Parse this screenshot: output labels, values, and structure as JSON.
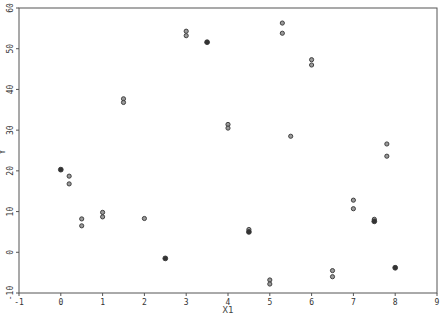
{
  "chart_data": {
    "type": "scatter",
    "title": "",
    "xlabel": "X1",
    "ylabel": "Y",
    "xlim": [
      -1,
      9
    ],
    "ylim": [
      -10,
      60
    ],
    "xticks": [
      -1,
      0,
      1,
      2,
      3,
      4,
      5,
      6,
      7,
      8,
      9
    ],
    "yticks": [
      -10,
      0,
      10,
      20,
      30,
      40,
      50,
      60
    ],
    "grid": false,
    "legend": null,
    "marker_color": "#333333",
    "points": [
      {
        "x": 0,
        "y": 20.3,
        "filled": true
      },
      {
        "x": 0.2,
        "y": 18.7,
        "filled": false
      },
      {
        "x": 0.2,
        "y": 16.8,
        "filled": false
      },
      {
        "x": 0.5,
        "y": 8.2,
        "filled": false
      },
      {
        "x": 0.5,
        "y": 6.5,
        "filled": false
      },
      {
        "x": 1,
        "y": 9.8,
        "filled": false
      },
      {
        "x": 1,
        "y": 8.7,
        "filled": false
      },
      {
        "x": 1.5,
        "y": 37.7,
        "filled": false
      },
      {
        "x": 1.5,
        "y": 36.8,
        "filled": false
      },
      {
        "x": 2,
        "y": 8.3,
        "filled": false
      },
      {
        "x": 2.5,
        "y": -1.5,
        "filled": true
      },
      {
        "x": 3,
        "y": 54.3,
        "filled": false
      },
      {
        "x": 3,
        "y": 53.2,
        "filled": false
      },
      {
        "x": 3.5,
        "y": 51.6,
        "filled": true
      },
      {
        "x": 4,
        "y": 31.4,
        "filled": false
      },
      {
        "x": 4,
        "y": 30.5,
        "filled": false
      },
      {
        "x": 4.5,
        "y": 5.6,
        "filled": false
      },
      {
        "x": 4.5,
        "y": 5.0,
        "filled": true
      },
      {
        "x": 5,
        "y": -6.8,
        "filled": false
      },
      {
        "x": 5,
        "y": -7.8,
        "filled": false
      },
      {
        "x": 5.3,
        "y": 56.3,
        "filled": false
      },
      {
        "x": 5.3,
        "y": 53.8,
        "filled": false
      },
      {
        "x": 5.5,
        "y": 28.5,
        "filled": false
      },
      {
        "x": 6,
        "y": 47.3,
        "filled": false
      },
      {
        "x": 6,
        "y": 46.0,
        "filled": false
      },
      {
        "x": 6.5,
        "y": -4.5,
        "filled": false
      },
      {
        "x": 6.5,
        "y": -6.0,
        "filled": false
      },
      {
        "x": 7,
        "y": 12.8,
        "filled": false
      },
      {
        "x": 7,
        "y": 10.7,
        "filled": false
      },
      {
        "x": 7.5,
        "y": 8.1,
        "filled": false
      },
      {
        "x": 7.5,
        "y": 7.6,
        "filled": true
      },
      {
        "x": 7.8,
        "y": 26.6,
        "filled": false
      },
      {
        "x": 7.8,
        "y": 23.6,
        "filled": false
      },
      {
        "x": 8,
        "y": -3.8,
        "filled": true
      }
    ]
  },
  "axes": {
    "x_label": "X1",
    "y_label": "Y"
  }
}
